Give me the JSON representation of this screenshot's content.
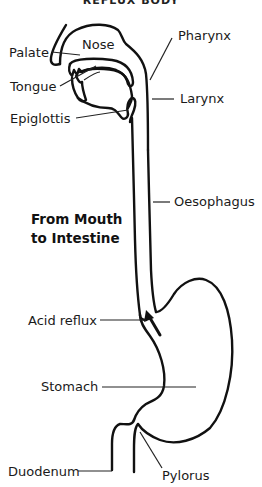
{
  "header": {
    "text": "REFLUX BODY"
  },
  "title": {
    "line1": "From Mouth",
    "line2": "to Intestine"
  },
  "labels": {
    "nose": "Nose",
    "pharynx": "Pharynx",
    "palate": "Palate",
    "tongue": "Tongue",
    "larynx": "Larynx",
    "epiglottis": "Epiglottis",
    "oesophagus": "Oesophagus",
    "acid_reflux": "Acid reflux",
    "stomach": "Stomach",
    "duodenum": "Duodenum",
    "pylorus": "Pylorus"
  },
  "colors": {
    "line": "#111111",
    "background": "#ffffff"
  }
}
